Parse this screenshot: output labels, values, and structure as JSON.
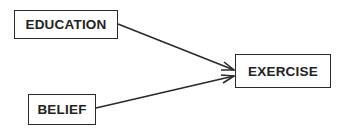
{
  "diagram": {
    "type": "path-diagram",
    "nodes": [
      {
        "id": "education",
        "label": "EDUCATION",
        "x": 14,
        "y": 10,
        "w": 104,
        "h": 29
      },
      {
        "id": "belief",
        "label": "BELIEF",
        "x": 28,
        "y": 94,
        "w": 68,
        "h": 31
      },
      {
        "id": "exercise",
        "label": "EXERCISE",
        "x": 235,
        "y": 54,
        "w": 96,
        "h": 34
      }
    ],
    "edges": [
      {
        "from": "education",
        "to": "exercise",
        "x1": 118,
        "y1": 24,
        "x2": 234,
        "y2": 70
      },
      {
        "from": "belief",
        "to": "exercise",
        "x1": 96,
        "y1": 108,
        "x2": 234,
        "y2": 76
      }
    ],
    "colors": {
      "stroke": "#2a2a2a",
      "text": "#222222",
      "background": "#ffffff"
    }
  }
}
